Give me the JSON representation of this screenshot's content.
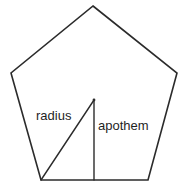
{
  "figure": {
    "kind": "geometry-diagram",
    "shape_name": "regular-pentagon",
    "width": 188,
    "height": 191,
    "background_color": "#ffffff",
    "stroke_color": "#2b2b2b",
    "text_color": "#1f1f1f",
    "stroke_width": 1.6
  },
  "labels": {
    "radius": "radius",
    "apothem": "apothem"
  },
  "geometry": {
    "pentagon": {
      "points": "93,6 177,73 148,180 41,180 11,73",
      "vertices": [
        {
          "name": "top",
          "x": 93,
          "y": 6
        },
        {
          "name": "right",
          "x": 177,
          "y": 73
        },
        {
          "name": "bottom-right",
          "x": 148,
          "y": 180
        },
        {
          "name": "bottom-left",
          "x": 41,
          "y": 180
        },
        {
          "name": "left",
          "x": 11,
          "y": 73
        }
      ]
    },
    "center": {
      "x": 94,
      "y": 100
    },
    "radius_line": {
      "x1": 94,
      "y1": 100,
      "x2": 41,
      "y2": 180
    },
    "apothem_line": {
      "x1": 94,
      "y1": 100,
      "x2": 94,
      "y2": 180
    }
  }
}
